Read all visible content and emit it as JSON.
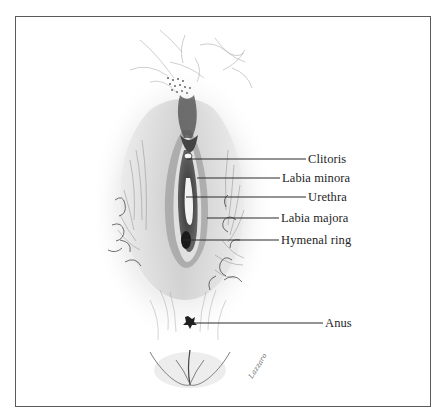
{
  "figure": {
    "type": "anatomical-illustration",
    "style": "pencil-sketch",
    "border_color": "#5a5a5a",
    "ink_color": "#1e1e1e"
  },
  "labels": [
    {
      "id": "clitoris",
      "text": "Clitoris",
      "x": 308,
      "y": 152,
      "line": {
        "x1": 187,
        "y1": 159,
        "x2": 306,
        "y2": 159
      }
    },
    {
      "id": "labia-minora",
      "text": "Labia minora",
      "x": 282,
      "y": 171,
      "line": {
        "x1": 197,
        "y1": 178,
        "x2": 280,
        "y2": 178
      }
    },
    {
      "id": "urethra",
      "text": "Urethra",
      "x": 308,
      "y": 190,
      "line": {
        "x1": 186,
        "y1": 197,
        "x2": 306,
        "y2": 197
      }
    },
    {
      "id": "labia-majora",
      "text": "Labia majora",
      "x": 281,
      "y": 211,
      "line": {
        "x1": 207,
        "y1": 218,
        "x2": 279,
        "y2": 218
      }
    },
    {
      "id": "hymenal-ring",
      "text": "Hymenal ring",
      "x": 281,
      "y": 233,
      "line": {
        "x1": 183,
        "y1": 240,
        "x2": 279,
        "y2": 240
      }
    },
    {
      "id": "anus",
      "text": "Anus",
      "x": 325,
      "y": 316,
      "line": {
        "x1": 193,
        "y1": 323,
        "x2": 323,
        "y2": 323
      }
    }
  ],
  "signature": {
    "text": "Lazzaro"
  }
}
